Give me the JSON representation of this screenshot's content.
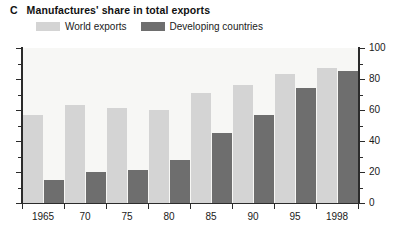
{
  "panel": {
    "letter": "C",
    "title": "Manufactures' share in total exports"
  },
  "legend": {
    "items": [
      {
        "label": "World exports",
        "color": "#d4d4d4",
        "swatch_name": "world-exports-swatch"
      },
      {
        "label": "Developing countries",
        "color": "#6e6e6e",
        "swatch_name": "developing-countries-swatch"
      }
    ]
  },
  "axes": {
    "y_tick_labels": [
      "0",
      "20",
      "40",
      "60",
      "80",
      "100"
    ],
    "y_min": 0,
    "y_max": 100,
    "y_major_step": 20,
    "y_minor_step": 10,
    "x_tick_labels": [
      "1965",
      "70",
      "75",
      "80",
      "85",
      "90",
      "95",
      "1998"
    ]
  },
  "chart_data": {
    "type": "bar",
    "title": "Manufactures' share in total exports",
    "xlabel": "",
    "ylabel": "",
    "ylim": [
      0,
      100
    ],
    "grid": false,
    "legend_position": "top-left",
    "categories": [
      "1965",
      "70",
      "75",
      "80",
      "85",
      "90",
      "95",
      "1998"
    ],
    "series": [
      {
        "name": "World exports",
        "color": "#d4d4d4",
        "values": [
          57,
          63,
          61,
          60,
          71,
          76,
          83,
          87
        ]
      },
      {
        "name": "Developing countries",
        "color": "#6e6e6e",
        "values": [
          15,
          20,
          21,
          28,
          45,
          57,
          74,
          85
        ]
      }
    ]
  }
}
